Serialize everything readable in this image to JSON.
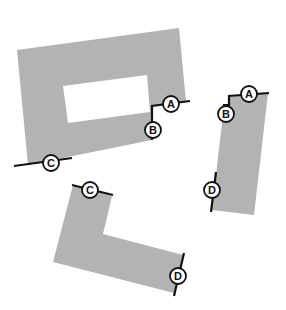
{
  "diagram": {
    "type": "puzzle-pieces",
    "pieces": [
      {
        "id": "frame",
        "description": "rectangular frame with rectangular hole"
      },
      {
        "id": "bar",
        "description": "tall narrow bar with notch at top-left"
      },
      {
        "id": "l-shape",
        "description": "L-shaped piece"
      }
    ],
    "markers": [
      {
        "label": "A",
        "piece": "frame"
      },
      {
        "label": "B",
        "piece": "frame"
      },
      {
        "label": "C",
        "piece": "frame"
      },
      {
        "label": "A",
        "piece": "bar"
      },
      {
        "label": "B",
        "piece": "bar"
      },
      {
        "label": "D",
        "piece": "bar"
      },
      {
        "label": "C",
        "piece": "l-shape"
      },
      {
        "label": "D",
        "piece": "l-shape"
      }
    ],
    "colors": {
      "piece_fill": "#b3b3b3",
      "background": "#ffffff",
      "marker_stroke": "#111111"
    }
  }
}
